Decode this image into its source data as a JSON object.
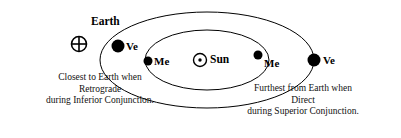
{
  "diagram": {
    "title_labels": {
      "earth": "Earth",
      "sun": "Sun"
    },
    "symbols": {
      "earth_symbol": "earth-symbol-circle-cross",
      "sun_symbol": "sun-symbol-circle-dot"
    },
    "planet_markers": [
      {
        "id": "venus-left",
        "label": "Ve",
        "x": 118,
        "y": 46,
        "r": 6.5,
        "label_x": 126,
        "label_y": 41
      },
      {
        "id": "mercury-left",
        "label": "Me",
        "x": 148,
        "y": 61,
        "r": 4.5,
        "label_x": 154,
        "label_y": 56
      },
      {
        "id": "mercury-right",
        "label": "Me",
        "x": 258,
        "y": 55,
        "r": 4.5,
        "label_x": 264,
        "label_y": 58
      },
      {
        "id": "venus-right",
        "label": "Ve",
        "x": 314,
        "y": 60,
        "r": 6.5,
        "label_x": 323,
        "label_y": 55
      }
    ],
    "captions": {
      "left": {
        "lines": [
          "Closest to Earth when",
          "Retrograde",
          "during Inferior Conjunction."
        ]
      },
      "right": {
        "lines": [
          "Furthest from Earth when",
          "Direct",
          "during Superior Conjunction."
        ]
      }
    },
    "orbits": {
      "venus_orbit": "outer-ellipse",
      "mercury_orbit": "inner-ellipse",
      "center_x": 207,
      "center_y": 60,
      "venus_rx": 107,
      "venus_ry": 48,
      "mercury_rx": 62,
      "mercury_ry": 30
    },
    "colors": {
      "stroke": "#000000",
      "background": "#ffffff",
      "planet_fill": "#000000"
    }
  }
}
